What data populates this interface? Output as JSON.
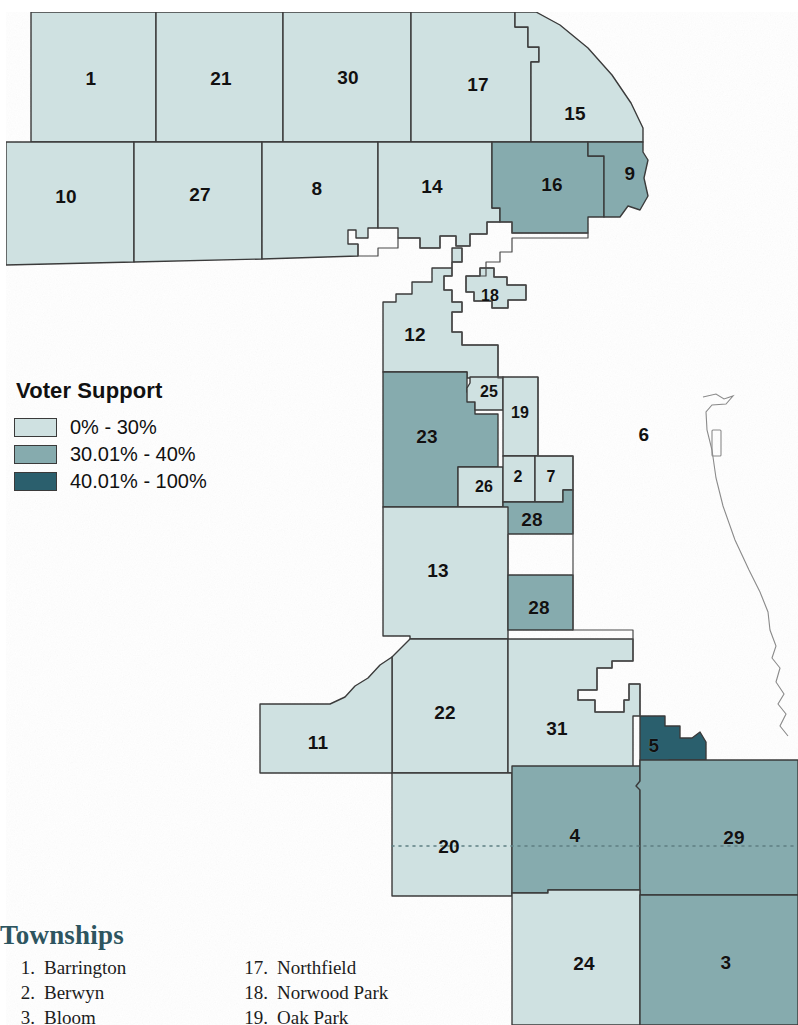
{
  "map": {
    "title_visible": false,
    "colors": {
      "light": "#cfe1e1",
      "medium": "#86abae",
      "dark": "#2b5f6d",
      "excluded": "#ffffff",
      "border": "#3a3a3a",
      "hairline": "#6b6b6b"
    },
    "regions": [
      {
        "id": "1",
        "label": "1",
        "x": 91,
        "y": 78,
        "class": "light"
      },
      {
        "id": "21",
        "label": "21",
        "x": 221,
        "y": 78,
        "class": "light"
      },
      {
        "id": "30",
        "label": "30",
        "x": 348,
        "y": 77,
        "class": "light"
      },
      {
        "id": "17",
        "label": "17",
        "x": 478,
        "y": 84,
        "class": "light"
      },
      {
        "id": "15",
        "label": "15",
        "x": 575,
        "y": 113,
        "class": "light"
      },
      {
        "id": "10",
        "label": "10",
        "x": 66,
        "y": 196,
        "class": "light"
      },
      {
        "id": "27",
        "label": "27",
        "x": 200,
        "y": 194,
        "class": "light"
      },
      {
        "id": "8",
        "label": "8",
        "x": 317,
        "y": 188,
        "class": "light"
      },
      {
        "id": "14",
        "label": "14",
        "x": 432,
        "y": 186,
        "class": "light"
      },
      {
        "id": "16",
        "label": "16",
        "x": 552,
        "y": 184,
        "class": "medium"
      },
      {
        "id": "9",
        "label": "9",
        "x": 630,
        "y": 173,
        "class": "medium"
      },
      {
        "id": "18",
        "label": "18",
        "x": 490,
        "y": 296,
        "class": "light"
      },
      {
        "id": "12",
        "label": "12",
        "x": 415,
        "y": 334,
        "class": "light"
      },
      {
        "id": "25",
        "label": "25",
        "x": 489,
        "y": 392,
        "class": "light"
      },
      {
        "id": "19",
        "label": "19",
        "x": 520,
        "y": 413,
        "class": "light"
      },
      {
        "id": "23",
        "label": "23",
        "x": 427,
        "y": 436,
        "class": "medium"
      },
      {
        "id": "6",
        "label": "6",
        "x": 644,
        "y": 434,
        "class": "excluded"
      },
      {
        "id": "26",
        "label": "26",
        "x": 484,
        "y": 487,
        "class": "light"
      },
      {
        "id": "2",
        "label": "2",
        "x": 518,
        "y": 477,
        "class": "light"
      },
      {
        "id": "7",
        "label": "7",
        "x": 551,
        "y": 477,
        "class": "light"
      },
      {
        "id": "28a",
        "label": "28",
        "x": 532,
        "y": 519,
        "class": "medium"
      },
      {
        "id": "13",
        "label": "13",
        "x": 438,
        "y": 570,
        "class": "light"
      },
      {
        "id": "28b",
        "label": "28",
        "x": 539,
        "y": 607,
        "class": "medium"
      },
      {
        "id": "22",
        "label": "22",
        "x": 445,
        "y": 712,
        "class": "light"
      },
      {
        "id": "31",
        "label": "31",
        "x": 557,
        "y": 728,
        "class": "light"
      },
      {
        "id": "11",
        "label": "11",
        "x": 318,
        "y": 742,
        "class": "light"
      },
      {
        "id": "5",
        "label": "5",
        "x": 654,
        "y": 745,
        "class": "dark"
      },
      {
        "id": "20",
        "label": "20",
        "x": 449,
        "y": 846,
        "class": "light"
      },
      {
        "id": "4",
        "label": "4",
        "x": 575,
        "y": 835,
        "class": "medium"
      },
      {
        "id": "29",
        "label": "29",
        "x": 734,
        "y": 837,
        "class": "medium"
      },
      {
        "id": "24",
        "label": "24",
        "x": 584,
        "y": 963,
        "class": "light"
      },
      {
        "id": "3",
        "label": "3",
        "x": 726,
        "y": 962,
        "class": "medium"
      }
    ]
  },
  "legend": {
    "title": "Voter Support",
    "items": [
      {
        "label": "0% - 30%",
        "color": "#cfe1e1"
      },
      {
        "label": "30.01% - 40%",
        "color": "#86abae"
      },
      {
        "label": "40.01% - 100%",
        "color": "#2b5f6d"
      }
    ]
  },
  "townships": {
    "title": "Townships",
    "column_left": [
      {
        "num": "1.",
        "name": "Barrington"
      },
      {
        "num": "2.",
        "name": "Berwyn"
      },
      {
        "num": "3.",
        "name": "Bloom"
      }
    ],
    "column_right": [
      {
        "num": "17.",
        "name": "Northfield"
      },
      {
        "num": "18.",
        "name": "Norwood Park"
      },
      {
        "num": "19.",
        "name": "Oak Park"
      }
    ]
  }
}
